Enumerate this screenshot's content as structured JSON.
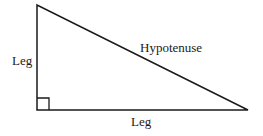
{
  "diagram": {
    "labels": {
      "left_leg": "Leg",
      "bottom_leg": "Leg",
      "hypotenuse": "Hypotenuse"
    },
    "vertices": {
      "top": [
        37,
        5
      ],
      "right_angle": [
        37,
        110
      ],
      "right": [
        248,
        110
      ]
    },
    "right_angle_marker_size": 12,
    "stroke_color": "#1a1a1a"
  }
}
